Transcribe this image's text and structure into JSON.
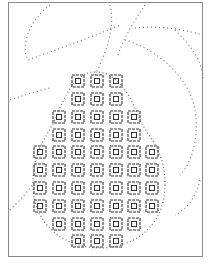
{
  "artwork": {
    "subject": "pear",
    "style": "dotted outline with concentric-square grid pattern",
    "colors": {
      "ink": "#333333",
      "dots": "#777777",
      "frame": "#8a8a8a",
      "background": "#ffffff"
    },
    "grid": {
      "rows": [
        {
          "y": 81,
          "xs": [
            78,
            97,
            116
          ]
        },
        {
          "y": 99,
          "xs": [
            78,
            97,
            116
          ]
        },
        {
          "y": 117,
          "xs": [
            59,
            78,
            97,
            116,
            134
          ]
        },
        {
          "y": 135,
          "xs": [
            59,
            78,
            97,
            116,
            134
          ]
        },
        {
          "y": 152,
          "xs": [
            40,
            59,
            78,
            97,
            116,
            134,
            152
          ]
        },
        {
          "y": 170,
          "xs": [
            40,
            59,
            78,
            97,
            116,
            134,
            152
          ]
        },
        {
          "y": 188,
          "xs": [
            40,
            59,
            78,
            97,
            116,
            134,
            152
          ]
        },
        {
          "y": 206,
          "xs": [
            40,
            59,
            78,
            97,
            116,
            134,
            152
          ]
        },
        {
          "y": 224,
          "xs": [
            59,
            78,
            97,
            116,
            134
          ]
        },
        {
          "y": 241,
          "xs": [
            78,
            97,
            116
          ]
        }
      ]
    }
  }
}
